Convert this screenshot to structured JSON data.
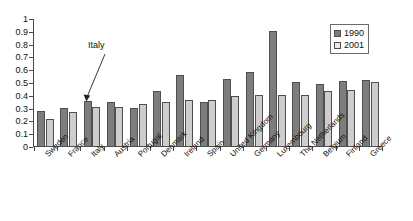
{
  "chart_data": {
    "type": "bar",
    "title": "",
    "xlabel": "",
    "ylabel": "",
    "ylim": [
      0,
      1
    ],
    "grid": false,
    "legend_position": "top-right",
    "categories": [
      "Sweden",
      "France",
      "Italy",
      "Austria",
      "Portugal",
      "Denmark",
      "Ireland",
      "Spain",
      "United Kingdom",
      "Germany",
      "Luxembourg",
      "The Netherlands",
      "Belgium",
      "Finland",
      "Greece"
    ],
    "series": [
      {
        "name": "1990",
        "color": "#7d7d7d",
        "values": [
          0.285,
          0.305,
          0.36,
          0.35,
          0.305,
          0.44,
          0.565,
          0.35,
          0.535,
          0.585,
          0.91,
          0.505,
          0.49,
          0.515,
          0.525
        ]
      },
      {
        "name": "2001",
        "color": "#cdcdcd",
        "values": [
          0.215,
          0.27,
          0.315,
          0.315,
          0.335,
          0.355,
          0.37,
          0.365,
          0.4,
          0.41,
          0.41,
          0.41,
          0.44,
          0.445,
          0.51
        ]
      }
    ],
    "yticks": [
      "0",
      "0.1",
      "0.2",
      "0.3",
      "0.4",
      "0.5",
      "0.6",
      "0.7",
      "0.8",
      "0.9",
      "1"
    ],
    "ytick_values": [
      0,
      0.1,
      0.2,
      0.3,
      0.4,
      0.5,
      0.6,
      0.7,
      0.8,
      0.9,
      1
    ],
    "annotations": [
      {
        "text": "Italy",
        "points_to_category": "Italy",
        "points_to_series": "1990"
      }
    ]
  }
}
